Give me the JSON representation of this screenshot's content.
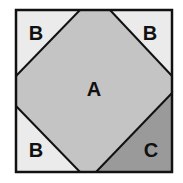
{
  "diagram": {
    "outer_square": {
      "x": 16,
      "y": 10,
      "size": 156,
      "fill": "#ebebeb",
      "stroke": "#111111"
    },
    "region_a": {
      "label": "A",
      "fill": "#c4c4c4",
      "points": "80,10 110,10 172,76 172,93 96,172 80,172 16,106 16,76"
    },
    "region_c": {
      "label": "C",
      "fill": "#9a9a9a",
      "points": "172,93 172,172 96,172"
    },
    "corner_labels": [
      {
        "label": "B",
        "x": 36,
        "y": 40
      },
      {
        "label": "B",
        "x": 150,
        "y": 40
      },
      {
        "label": "B",
        "x": 36,
        "y": 157
      }
    ],
    "label_a_pos": {
      "x": 94,
      "y": 96
    },
    "label_c_pos": {
      "x": 151,
      "y": 157
    }
  }
}
